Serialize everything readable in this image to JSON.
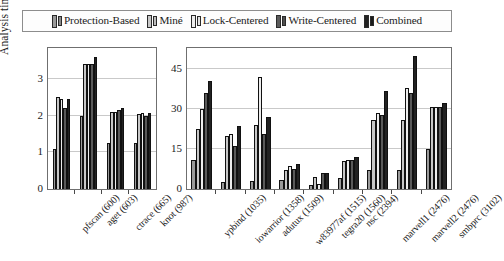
{
  "legend": {
    "position": "top",
    "items": [
      {
        "label": "Protection-Based",
        "color": "#9a9a9a",
        "color2": "#8a8a8a"
      },
      {
        "label": "Miné",
        "color": "#c7c7c7",
        "color2": "#bcbcbc"
      },
      {
        "label": "Lock-Centered",
        "color": "#ededed",
        "color2": "#e2e2e2"
      },
      {
        "label": "Write-Centered",
        "color": "#5a5a5a",
        "color2": "#4e4e4e"
      },
      {
        "label": "Combined",
        "color": "#222222",
        "color2": "#1a1a1a"
      }
    ]
  },
  "chart_data": [
    {
      "type": "bar",
      "id": "left",
      "title": "",
      "xlabel": "",
      "ylabel": "Analysis time [s]",
      "ylim": [
        0,
        3.85
      ],
      "yticks": [
        0,
        1,
        2,
        3
      ],
      "ytick_labels": [
        "0",
        "1",
        "2",
        "3"
      ],
      "grid": true,
      "categories": [
        "pfscan (600)",
        "aget (603)",
        "ctrace (665)",
        "knot (987)"
      ],
      "series": [
        {
          "name": "Protection-Based",
          "color": "#9a9a9a",
          "values": [
            1.1,
            2.0,
            1.27,
            1.25
          ]
        },
        {
          "name": "Miné",
          "color": "#c7c7c7",
          "values": [
            2.5,
            3.4,
            2.1,
            2.05
          ]
        },
        {
          "name": "Lock-Centered",
          "color": "#ededed",
          "values": [
            2.45,
            3.4,
            2.1,
            2.07
          ]
        },
        {
          "name": "Write-Centered",
          "color": "#5a5a5a",
          "values": [
            2.2,
            3.4,
            2.15,
            2.0
          ]
        },
        {
          "name": "Combined",
          "color": "#222222",
          "values": [
            2.45,
            3.6,
            2.2,
            2.08
          ]
        }
      ]
    },
    {
      "type": "bar",
      "id": "right",
      "title": "",
      "xlabel": "",
      "ylabel": "",
      "ylim": [
        0,
        53
      ],
      "yticks": [
        0,
        15,
        30,
        45
      ],
      "ytick_labels": [
        "0",
        "15",
        "30",
        "45"
      ],
      "grid": true,
      "categories": [
        "ypbind (1035)",
        "iowarrior (1358)",
        "adutux (1509)",
        "w83977af (1515)",
        "tegra20 (1560)",
        "nsc (2394)",
        "marvell1 (2476)",
        "marvell2 (2476)",
        "smbprc (3102)"
      ],
      "series": [
        {
          "name": "Protection-Based",
          "color": "#9a9a9a",
          "values": [
            11.0,
            2.5,
            3.0,
            3.5,
            1.5,
            4.0,
            7.0,
            7.0,
            15.0
          ]
        },
        {
          "name": "Miné",
          "color": "#c7c7c7",
          "values": [
            22.5,
            20.0,
            24.0,
            7.0,
            4.5,
            10.5,
            26.0,
            26.0,
            31.0
          ]
        },
        {
          "name": "Lock-Centered",
          "color": "#ededed",
          "values": [
            30.0,
            20.5,
            42.0,
            8.5,
            2.0,
            11.0,
            28.5,
            38.0,
            31.0
          ]
        },
        {
          "name": "Write-Centered",
          "color": "#5a5a5a",
          "values": [
            36.0,
            16.0,
            20.5,
            7.5,
            6.0,
            11.0,
            28.0,
            36.0,
            31.0
          ]
        },
        {
          "name": "Combined",
          "color": "#222222",
          "values": [
            40.5,
            23.5,
            27.0,
            9.5,
            6.0,
            12.0,
            37.0,
            50.0,
            32.5
          ]
        }
      ]
    }
  ]
}
